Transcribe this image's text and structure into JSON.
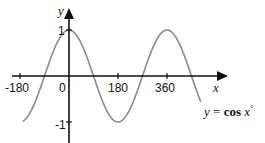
{
  "chart_data": {
    "type": "line",
    "title": "",
    "function_label": "y = cos x°",
    "function_parts": {
      "lhs": "y",
      "eq": " = ",
      "fn": "cos",
      "var": " x",
      "deg": "°"
    },
    "xlabel": "x",
    "ylabel": "y",
    "x_ticks": [
      -180,
      0,
      180,
      360
    ],
    "x_tick_labels": [
      "-180",
      "0",
      "180",
      "360"
    ],
    "y_ticks": [
      1,
      -1
    ],
    "y_tick_labels": [
      "1",
      "-1"
    ],
    "xlim": [
      -180,
      540
    ],
    "ylim": [
      -1,
      1
    ],
    "grid": false,
    "legend": "none",
    "series": [
      {
        "name": "y = cos x°",
        "color": "#8a8a8a",
        "x_range": [
          -170,
          485
        ],
        "x": [
          -170,
          -135,
          -90,
          -45,
          0,
          45,
          90,
          135,
          180,
          225,
          270,
          315,
          360,
          405,
          450,
          485
        ],
        "values": [
          -0.985,
          -0.707,
          0,
          0.707,
          1,
          0.707,
          0,
          -0.707,
          -1,
          -0.707,
          0,
          0.707,
          1,
          0.707,
          0,
          -0.423
        ]
      }
    ],
    "colors": {
      "axes": "#111111",
      "curve": "#8a8a8a"
    }
  }
}
